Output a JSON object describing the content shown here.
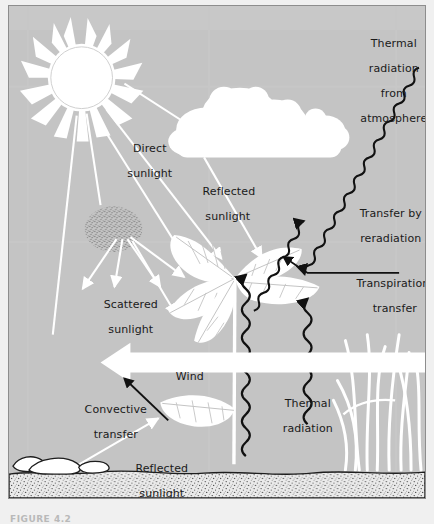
{
  "figure": {
    "caption": "FIGURE 4.2",
    "background_color": "#c4c4c4",
    "panel_border_color": "#8d8d8d",
    "white_element_color": "#ffffff",
    "arrow_dark_color": "#111111",
    "text_color": "#1a1a1a",
    "ground_color": "#e8e8e8"
  },
  "labels": [
    {
      "id": "thermal-radiation-from-atmosphere",
      "name": "label-thermal-radiation-from-atmosphere",
      "lines": [
        "Thermal",
        "radiation",
        "from",
        "atmosphere"
      ],
      "text": "Thermal radiation from atmosphere",
      "x": 334,
      "y": 24,
      "width": 96,
      "align": "center"
    },
    {
      "id": "direct-sunlight",
      "name": "label-direct-sunlight",
      "lines": [
        "Direct",
        "sunlight"
      ],
      "text": "Direct sunlight",
      "x": 104,
      "y": 129,
      "width": 68,
      "align": "center"
    },
    {
      "id": "reflected-sunlight-upper",
      "name": "label-reflected-sunlight-upper",
      "lines": [
        "Reflected",
        "sunlight"
      ],
      "text": "Reflected sunlight",
      "x": 180,
      "y": 172,
      "width": 72,
      "align": "center"
    },
    {
      "id": "transfer-by-reradiation",
      "name": "label-transfer-by-reradiation",
      "lines": [
        "Transfer by",
        "reradiation"
      ],
      "text": "Transfer by reradiation",
      "x": 334,
      "y": 194,
      "width": 86,
      "align": "center"
    },
    {
      "id": "transpirational-transfer",
      "name": "label-transpirational-transfer",
      "lines": [
        "Transpirational",
        "transfer"
      ],
      "text": "Transpirational transfer",
      "x": 334,
      "y": 264,
      "width": 94,
      "align": "center"
    },
    {
      "id": "scattered-sunlight",
      "name": "label-scattered-sunlight",
      "lines": [
        "Scattered",
        "sunlight"
      ],
      "text": "Scattered sunlight",
      "x": 80,
      "y": 285,
      "width": 76,
      "align": "center"
    },
    {
      "id": "wind",
      "name": "label-wind",
      "lines": [
        "Wind"
      ],
      "text": "Wind",
      "x": 148,
      "y": 358,
      "width": 60,
      "align": "center"
    },
    {
      "id": "thermal-radiation-ground",
      "name": "label-thermal-radiation-ground",
      "lines": [
        "Thermal",
        "radiation"
      ],
      "text": "Thermal radiation",
      "x": 256,
      "y": 384,
      "width": 78,
      "align": "center"
    },
    {
      "id": "convective-transfer",
      "name": "label-convective-transfer",
      "lines": [
        "Convective",
        "transfer"
      ],
      "text": "Convective transfer",
      "x": 62,
      "y": 390,
      "width": 80,
      "align": "center"
    },
    {
      "id": "reflected-sunlight-lower",
      "name": "label-reflected-sunlight-lower",
      "lines": [
        "Reflected",
        "sunlight"
      ],
      "text": "Reflected sunlight",
      "x": 110,
      "y": 449,
      "width": 78,
      "align": "center"
    }
  ],
  "elements": {
    "sun": {
      "name": "sun-icon",
      "cx": 73,
      "cy": 72,
      "r": 33,
      "rays": 16
    },
    "cloud": {
      "name": "cloud-icon",
      "x": 172,
      "y": 88,
      "width": 160,
      "height": 70
    },
    "scatter_blob": {
      "name": "scattered-particles-icon",
      "cx": 105,
      "cy": 224,
      "rx": 28,
      "ry": 22
    },
    "plant_upper": {
      "name": "plant-upper-icon",
      "stem_x": 228,
      "leaves": 5
    },
    "leaf_lower": {
      "name": "leaf-lower-icon",
      "x": 145,
      "y": 395
    },
    "grass": {
      "name": "grass-icon",
      "x": 345,
      "blades": 9
    },
    "ground": {
      "name": "ground-soil-band",
      "top": 465,
      "height": 34
    },
    "wind_arrow": {
      "name": "wind-arrow",
      "from_x": 418,
      "to_x": 96,
      "y": 358
    }
  },
  "flows": [
    {
      "name": "flow-direct-sunlight",
      "kind": "straight",
      "color": "#ffffff",
      "from": "sun",
      "to": "plant",
      "label": "Direct sunlight"
    },
    {
      "name": "flow-reflected-sunlight-upper",
      "kind": "straight",
      "color": "#ffffff",
      "from": "cloud",
      "to": "plant",
      "label": "Reflected sunlight"
    },
    {
      "name": "flow-scattered-sunlight",
      "kind": "straight",
      "color": "#ffffff",
      "from": "scatter-blob",
      "to": "plant",
      "label": "Scattered sunlight"
    },
    {
      "name": "flow-reflected-sunlight-lower",
      "kind": "straight",
      "color": "#ffffff",
      "from": "ground",
      "to": "leaf-lower",
      "label": "Reflected sunlight"
    },
    {
      "name": "flow-thermal-radiation-from-atmosphere",
      "kind": "wavy",
      "color": "#111111",
      "direction": "down-left",
      "label": "Thermal radiation from atmosphere"
    },
    {
      "name": "flow-transfer-by-reradiation",
      "kind": "wavy",
      "color": "#111111",
      "direction": "up-right",
      "label": "Transfer by reradiation"
    },
    {
      "name": "flow-transpirational-transfer",
      "kind": "straight",
      "color": "#111111",
      "direction": "down-left",
      "label": "Transpirational transfer"
    },
    {
      "name": "flow-thermal-radiation-ground-1",
      "kind": "wavy",
      "color": "#111111",
      "direction": "up",
      "label": "Thermal radiation"
    },
    {
      "name": "flow-thermal-radiation-ground-2",
      "kind": "wavy",
      "color": "#111111",
      "direction": "up",
      "label": "Thermal radiation"
    },
    {
      "name": "flow-convective-transfer",
      "kind": "straight",
      "color": "#111111",
      "direction": "up-left",
      "label": "Convective transfer"
    },
    {
      "name": "flow-wind",
      "kind": "block-arrow",
      "color": "#ffffff",
      "direction": "left",
      "label": "Wind"
    }
  ]
}
